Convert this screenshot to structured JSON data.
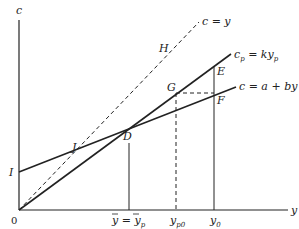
{
  "diagram": {
    "axes": {
      "y_axis_label": "c",
      "x_axis_label": "y",
      "origin_label": "0"
    },
    "lines": [
      {
        "id": "c_eq_y",
        "label": "c = y",
        "style": "dashed"
      },
      {
        "id": "cp_eq_kyp",
        "label_main": "c",
        "label_sub": "p",
        "label_eq": " = ky",
        "label_sub2": "p",
        "style": "solid"
      },
      {
        "id": "c_eq_a_by",
        "label": "c = a + by",
        "style": "solid"
      }
    ],
    "points": {
      "H": "H",
      "E": "E",
      "G": "G",
      "F": "F",
      "D": "D",
      "J": "J",
      "I": "I"
    },
    "x_ticks": [
      {
        "id": "ybar",
        "main": "y",
        "eq": " = ",
        "main2": "y",
        "sub2": "p"
      },
      {
        "id": "yp0",
        "main": "y",
        "sub": "p0"
      },
      {
        "id": "y0",
        "main": "y",
        "sub": "0"
      }
    ]
  },
  "colors": {
    "line": "#222222",
    "background": "#ffffff"
  }
}
